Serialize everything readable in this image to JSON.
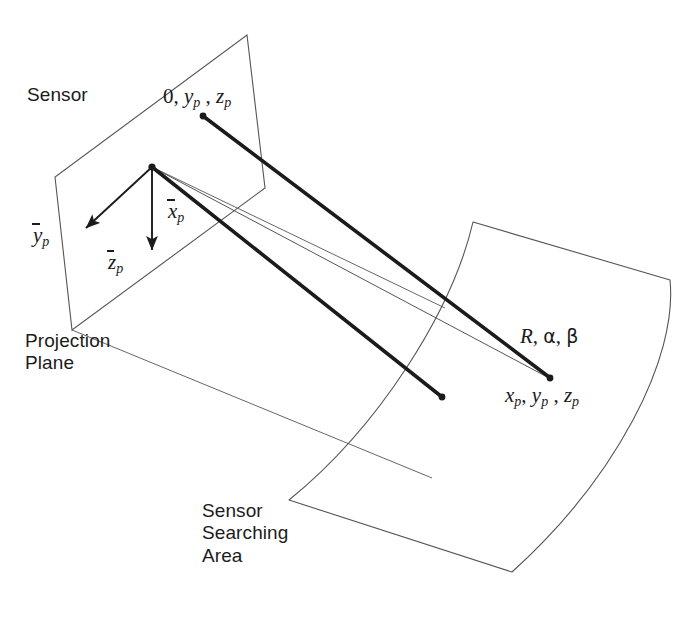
{
  "figure": {
    "type": "technical-diagram",
    "background_color": "#ffffff",
    "line_color": "#1b1b1b",
    "thin_line_color": "#4a4a4a"
  },
  "labels": {
    "sensor": "Sensor",
    "projection_plane_line1": "Projection",
    "projection_plane_line2": "Plane",
    "searching_area_line1": "Sensor",
    "searching_area_line2": "Searching",
    "searching_area_line3": "Area",
    "image_point_zero": "0",
    "image_point_y": "y",
    "image_point_z": "z",
    "axis_y": "y",
    "axis_z": "z",
    "axis_x": "x",
    "subscript_p": "p",
    "range_R": "R",
    "angle_alpha": "α",
    "angle_beta": "β",
    "target_x": "x",
    "target_y": "y",
    "target_z": "z",
    "comma": ",",
    "spaced_comma": " ,"
  },
  "geometry": {
    "projection_plane_points": "247,35 265,188 72,330 55,177",
    "origin_point": {
      "x": 152,
      "y": 167
    },
    "image_point": {
      "x": 202,
      "y": 115
    },
    "target_point": {
      "x": 550,
      "y": 378
    },
    "second_ray_end": {
      "x": 443,
      "y": 398
    },
    "ground_plane_points": "152,167 310,243 113,390",
    "search_area_outline": "M473,222 L670,280 C676,352 612,480 510,572 L290,500 C372,430 450,310 473,222 Z"
  }
}
